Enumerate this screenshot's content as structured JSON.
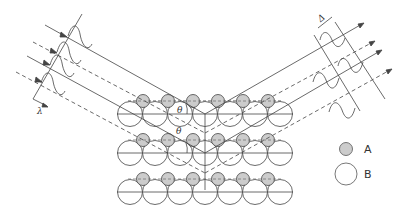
{
  "diagram": {
    "type": "bragg-diffraction-schematic",
    "colors": {
      "line": "#444444",
      "atom_a_fill": "#cccccc",
      "atom_b_fill": "#ffffff",
      "background": "#ffffff"
    },
    "labels": {
      "wavelength": "λ",
      "path_difference": "Δ",
      "angle_upper": "θ",
      "angle_lower": "θ"
    },
    "legend": [
      {
        "symbol": "small-gray-circle",
        "label": "A"
      },
      {
        "symbol": "large-white-circle",
        "label": "B"
      }
    ],
    "lattice": {
      "rows": 3,
      "b_atoms_per_row": 8,
      "a_atoms_per_row": 6
    },
    "beams": {
      "incident": [
        "solid",
        "dashed",
        "solid",
        "dashed"
      ],
      "diffracted": [
        "solid",
        "dashed",
        "solid",
        "dashed"
      ]
    }
  }
}
